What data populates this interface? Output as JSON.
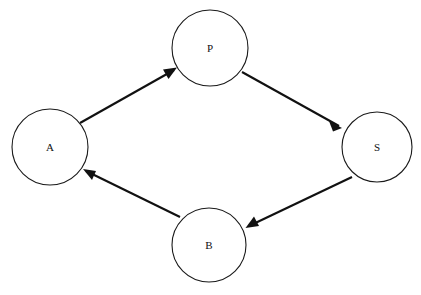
{
  "diagram": {
    "background_color": "#ffffff",
    "stroke_color": "#111111",
    "node_fill_color": "#ffffff",
    "node_stroke_color": "#1a1a1a",
    "nodes": [
      {
        "id": "A",
        "label": "A",
        "cx": 50,
        "cy": 147,
        "r": 38
      },
      {
        "id": "P",
        "label": "P",
        "cx": 210,
        "cy": 48,
        "r": 38
      },
      {
        "id": "S",
        "label": "S",
        "cx": 377,
        "cy": 147,
        "r": 35
      },
      {
        "id": "B",
        "label": "B",
        "cx": 209,
        "cy": 245,
        "r": 37
      }
    ],
    "edges": [
      {
        "id": "a-to-p",
        "from": "A",
        "to": "P",
        "direction": "up-right",
        "x1": 80,
        "y1": 123,
        "x2": 176,
        "y2": 69
      },
      {
        "id": "p-to-s",
        "from": "P",
        "to": "S",
        "direction": "down-right",
        "x1": 242,
        "y1": 72,
        "x2": 341,
        "y2": 127
      },
      {
        "id": "s-to-b",
        "from": "S",
        "to": "B",
        "direction": "down-left",
        "x1": 352,
        "y1": 177,
        "x2": 247,
        "y2": 227
      },
      {
        "id": "b-to-a",
        "from": "B",
        "to": "A",
        "direction": "up-left",
        "x1": 180,
        "y1": 217,
        "x2": 84,
        "y2": 170
      }
    ],
    "cycle_sequence": "A → P → S → B → A"
  }
}
